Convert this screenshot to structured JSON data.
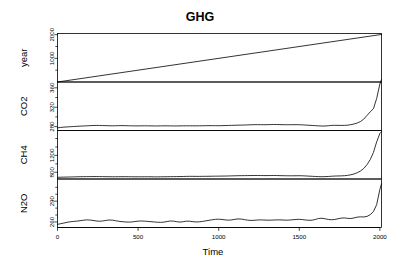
{
  "chart_data": {
    "type": "line",
    "title": "GHG",
    "xlabel": "Time",
    "ylabel": "",
    "grid": false,
    "legend": "none",
    "layout": "stacked multi-panel time series (R plot.ts)",
    "xlim": [
      0,
      2010
    ],
    "xticks": [
      0,
      500,
      1000,
      1500,
      2000
    ],
    "xtick_labels": [
      "0",
      "500",
      "1000",
      "1500",
      "2000"
    ],
    "panels": [
      {
        "name": "year",
        "label": "year",
        "ylim": [
          0,
          2050
        ],
        "yticks": [
          1000,
          2000
        ],
        "ytick_labels": [
          "1000",
          "2000"
        ],
        "minor_yticks": [
          500,
          1500
        ],
        "x": [
          0,
          2010
        ],
        "values": [
          0,
          2010
        ]
      },
      {
        "name": "CO2",
        "label": "CO2",
        "ylim": [
          272,
          372
        ],
        "yticks": [
          280,
          320,
          360
        ],
        "ytick_labels": [
          "280",
          "320",
          "360"
        ],
        "minor_yticks": [
          300,
          340
        ],
        "x": [
          0,
          20,
          40,
          60,
          80,
          100,
          120,
          140,
          160,
          180,
          200,
          220,
          240,
          260,
          280,
          300,
          320,
          340,
          360,
          380,
          400,
          420,
          440,
          460,
          480,
          500,
          520,
          540,
          560,
          580,
          600,
          620,
          640,
          660,
          680,
          700,
          720,
          740,
          760,
          780,
          800,
          820,
          840,
          860,
          880,
          900,
          920,
          940,
          960,
          980,
          1000,
          1020,
          1040,
          1060,
          1080,
          1100,
          1120,
          1140,
          1160,
          1180,
          1200,
          1220,
          1240,
          1260,
          1280,
          1300,
          1320,
          1340,
          1360,
          1380,
          1400,
          1420,
          1440,
          1460,
          1480,
          1500,
          1520,
          1540,
          1560,
          1580,
          1600,
          1620,
          1640,
          1660,
          1680,
          1700,
          1720,
          1740,
          1760,
          1780,
          1800,
          1820,
          1840,
          1860,
          1880,
          1900,
          1920,
          1940,
          1960,
          1980,
          2000,
          2010
        ],
        "values": [
          277.5,
          278.3,
          279.0,
          279.4,
          279.8,
          280.2,
          280.6,
          281.0,
          281.3,
          281.6,
          282.0,
          282.3,
          282.5,
          282.4,
          282.2,
          282.0,
          281.8,
          281.7,
          281.8,
          282.0,
          282.1,
          282.0,
          281.8,
          281.6,
          281.5,
          281.5,
          281.6,
          281.7,
          281.6,
          281.5,
          281.4,
          281.4,
          281.5,
          281.6,
          281.6,
          281.5,
          281.4,
          281.4,
          281.5,
          281.6,
          281.7,
          281.7,
          281.6,
          281.6,
          281.7,
          281.8,
          281.9,
          282.0,
          282.0,
          281.9,
          281.9,
          282.0,
          282.2,
          282.4,
          282.6,
          282.8,
          283.0,
          283.1,
          283.3,
          283.5,
          283.8,
          284.0,
          284.1,
          284.0,
          283.9,
          284.0,
          284.2,
          284.4,
          284.3,
          284.1,
          284.0,
          283.9,
          283.9,
          284.0,
          284.0,
          283.9,
          283.6,
          283.2,
          282.8,
          282.4,
          282.0,
          281.5,
          281.2,
          281.3,
          281.8,
          282.5,
          282.7,
          282.6,
          282.5,
          282.6,
          283.0,
          284.0,
          285.5,
          287.5,
          290.5,
          295.5,
          303.0,
          310.5,
          317.0,
          338.0,
          368.0,
          377.0
        ]
      },
      {
        "name": "CH4",
        "label": "CH4",
        "ylim": [
          640,
          1790
        ],
        "yticks": [
          800,
          1200
        ],
        "ytick_labels": [
          "800",
          "1200"
        ],
        "minor_yticks": [
          1000,
          1400,
          1600
        ],
        "x": [
          0,
          20,
          40,
          60,
          80,
          100,
          120,
          140,
          160,
          180,
          200,
          220,
          240,
          260,
          280,
          300,
          320,
          340,
          360,
          380,
          400,
          420,
          440,
          460,
          480,
          500,
          520,
          540,
          560,
          580,
          600,
          620,
          640,
          660,
          680,
          700,
          720,
          740,
          760,
          780,
          800,
          820,
          840,
          860,
          880,
          900,
          920,
          940,
          960,
          980,
          1000,
          1020,
          1040,
          1060,
          1080,
          1100,
          1120,
          1140,
          1160,
          1180,
          1200,
          1220,
          1240,
          1260,
          1280,
          1300,
          1320,
          1340,
          1360,
          1380,
          1400,
          1420,
          1440,
          1460,
          1480,
          1500,
          1520,
          1540,
          1560,
          1580,
          1600,
          1620,
          1640,
          1660,
          1680,
          1700,
          1720,
          1740,
          1760,
          1780,
          1800,
          1820,
          1840,
          1860,
          1880,
          1900,
          1920,
          1940,
          1960,
          1980,
          2000,
          2010
        ],
        "values": [
          680,
          682,
          684,
          686,
          688,
          690,
          692,
          694,
          695,
          696,
          697,
          698,
          698,
          697,
          696,
          695,
          694,
          693,
          693,
          694,
          695,
          695,
          694,
          693,
          692,
          692,
          692,
          693,
          693,
          692,
          691,
          691,
          692,
          693,
          694,
          695,
          696,
          697,
          698,
          700,
          702,
          703,
          703,
          702,
          702,
          703,
          704,
          705,
          706,
          707,
          708,
          709,
          710,
          712,
          714,
          716,
          718,
          719,
          720,
          721,
          722,
          723,
          723,
          722,
          721,
          721,
          722,
          723,
          722,
          720,
          718,
          717,
          716,
          716,
          717,
          718,
          716,
          712,
          708,
          704,
          700,
          696,
          694,
          696,
          700,
          706,
          710,
          712,
          714,
          718,
          726,
          740,
          760,
          790,
          830,
          890,
          980,
          1100,
          1270,
          1520,
          1720,
          1760
        ]
      },
      {
        "name": "N2O",
        "label": "N2O",
        "ylim": [
          252,
          322
        ],
        "yticks": [
          260,
          290
        ],
        "ytick_labels": [
          "260",
          "290"
        ],
        "minor_yticks": [
          270,
          280,
          300,
          310
        ],
        "x": [
          0,
          20,
          40,
          60,
          80,
          100,
          120,
          140,
          160,
          180,
          200,
          220,
          240,
          260,
          280,
          300,
          320,
          340,
          360,
          380,
          400,
          420,
          440,
          460,
          480,
          500,
          520,
          540,
          560,
          580,
          600,
          620,
          640,
          660,
          680,
          700,
          720,
          740,
          760,
          780,
          800,
          820,
          840,
          860,
          880,
          900,
          920,
          940,
          960,
          980,
          1000,
          1020,
          1040,
          1060,
          1080,
          1100,
          1120,
          1140,
          1160,
          1180,
          1200,
          1220,
          1240,
          1260,
          1280,
          1300,
          1320,
          1340,
          1360,
          1380,
          1400,
          1420,
          1440,
          1460,
          1480,
          1500,
          1520,
          1540,
          1560,
          1580,
          1600,
          1620,
          1640,
          1660,
          1680,
          1700,
          1720,
          1740,
          1760,
          1780,
          1800,
          1820,
          1840,
          1860,
          1880,
          1900,
          1920,
          1940,
          1960,
          1980,
          2000,
          2010
        ],
        "values": [
          256.5,
          257.5,
          258.5,
          259.5,
          260.3,
          260.8,
          261.2,
          261.8,
          262.5,
          263.0,
          262.8,
          262.2,
          261.5,
          261.0,
          261.4,
          262.2,
          262.8,
          262.6,
          261.8,
          261.0,
          260.4,
          260.0,
          259.8,
          260.0,
          260.6,
          261.2,
          261.4,
          261.2,
          260.8,
          260.4,
          260.0,
          259.6,
          259.4,
          259.8,
          260.6,
          261.4,
          261.2,
          260.4,
          259.8,
          260.4,
          261.2,
          261.0,
          260.4,
          260.0,
          260.2,
          260.8,
          261.6,
          262.4,
          263.2,
          263.8,
          264.0,
          263.6,
          263.0,
          262.6,
          263.0,
          263.8,
          264.4,
          264.2,
          263.4,
          262.6,
          262.2,
          262.4,
          262.8,
          263.0,
          262.8,
          262.6,
          262.6,
          262.8,
          263.0,
          263.0,
          262.8,
          262.6,
          262.8,
          263.2,
          263.6,
          263.8,
          263.4,
          262.8,
          262.4,
          262.6,
          263.6,
          265.0,
          265.4,
          264.6,
          263.6,
          263.2,
          263.6,
          264.6,
          265.6,
          265.8,
          265.2,
          265.0,
          265.8,
          267.0,
          267.4,
          267.2,
          268.0,
          270.5,
          275.0,
          285.0,
          307.0,
          315.0
        ]
      }
    ]
  }
}
